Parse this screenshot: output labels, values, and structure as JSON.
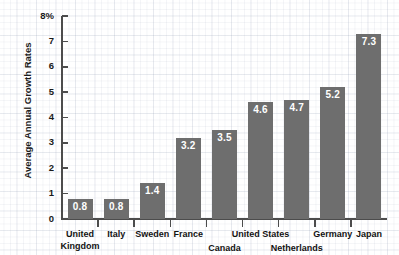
{
  "chart_data": {
    "type": "bar",
    "title": "",
    "xlabel": "",
    "ylabel": "Average Annual Growth Rates",
    "y_top_label": "8%",
    "ylim": [
      0,
      8
    ],
    "grid": true,
    "legend": "none",
    "categories": [
      "United Kingdom",
      "Italy",
      "Sweden",
      "France",
      "Canada",
      "United States",
      "Netherlands",
      "Germany",
      "Japan"
    ],
    "category_display": [
      "United\nKingdom",
      "Italy",
      "Sweden",
      "France",
      "Canada",
      "United States",
      "Netherlands",
      "Germany",
      "Japan"
    ],
    "values": [
      0.8,
      0.8,
      1.4,
      3.2,
      3.5,
      4.6,
      4.7,
      5.2,
      7.3
    ],
    "value_labels": [
      "0.8",
      "0.8",
      "1.4",
      "3.2",
      "3.5",
      "4.6",
      "4.7",
      "5.2",
      "7.3"
    ],
    "ytick_labels": [
      "8%",
      "7",
      "6",
      "5",
      "4",
      "3",
      "2",
      "1",
      "0"
    ],
    "ytick_values": [
      8,
      7,
      6,
      5,
      4,
      3,
      2,
      1,
      0
    ],
    "bar_color": "#6e6e6e",
    "value_label_color": "#ffffff",
    "axis_color": "#4c4c4c",
    "text_color": "#121212",
    "background_color": "#ffffff"
  }
}
